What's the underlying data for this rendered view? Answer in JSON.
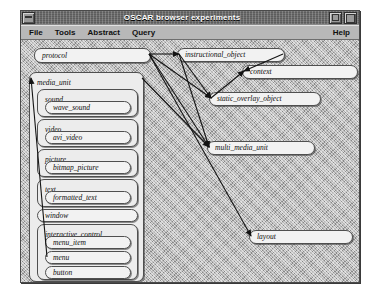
{
  "window": {
    "title": "OSCAR browser experiments",
    "menu_button_icon": "window-menu-icon",
    "minimize_icon": "minimize-icon",
    "maximize_icon": "maximize-icon"
  },
  "menubar": {
    "left_items": [
      {
        "label": "File"
      },
      {
        "label": "Tools"
      },
      {
        "label": "Abstract"
      },
      {
        "label": "Query"
      }
    ],
    "right_items": [
      {
        "label": "Help"
      }
    ]
  },
  "graph": {
    "nodes": [
      {
        "id": "protocol",
        "label": "protocol",
        "x": 13,
        "y": 8,
        "w": 117,
        "h": 15,
        "kind": "node"
      },
      {
        "id": "media_unit",
        "label": "media_unit",
        "x": 8,
        "y": 32,
        "w": 115,
        "h": 210,
        "kind": "group"
      },
      {
        "id": "sound",
        "label": "sound",
        "x": 16,
        "y": 49,
        "w": 101,
        "h": 28,
        "kind": "group"
      },
      {
        "id": "wave_sound",
        "label": "wave_sound",
        "x": 24,
        "y": 61,
        "w": 86,
        "h": 13,
        "kind": "node"
      },
      {
        "id": "video",
        "label": "video",
        "x": 16,
        "y": 79,
        "w": 101,
        "h": 28,
        "kind": "group"
      },
      {
        "id": "avi_video",
        "label": "avi_video",
        "x": 24,
        "y": 91,
        "w": 86,
        "h": 13,
        "kind": "node"
      },
      {
        "id": "picture",
        "label": "picture",
        "x": 16,
        "y": 109,
        "w": 101,
        "h": 28,
        "kind": "group"
      },
      {
        "id": "bitmap_picture",
        "label": "bitmap_picture",
        "x": 24,
        "y": 121,
        "w": 86,
        "h": 13,
        "kind": "node"
      },
      {
        "id": "text",
        "label": "text",
        "x": 16,
        "y": 139,
        "w": 101,
        "h": 28,
        "kind": "group"
      },
      {
        "id": "formatted_text",
        "label": "formatted_text",
        "x": 24,
        "y": 151,
        "w": 86,
        "h": 13,
        "kind": "node"
      },
      {
        "id": "window",
        "label": "window",
        "x": 16,
        "y": 169,
        "w": 101,
        "h": 13,
        "kind": "node"
      },
      {
        "id": "interactive_control",
        "label": "interactive_control",
        "x": 16,
        "y": 184,
        "w": 101,
        "h": 56,
        "kind": "group"
      },
      {
        "id": "menu_item",
        "label": "menu_item",
        "x": 24,
        "y": 196,
        "w": 86,
        "h": 13,
        "kind": "node"
      },
      {
        "id": "menu",
        "label": "menu",
        "x": 24,
        "y": 211,
        "w": 86,
        "h": 13,
        "kind": "node"
      },
      {
        "id": "button",
        "label": "button",
        "x": 24,
        "y": 226,
        "w": 86,
        "h": 13,
        "kind": "node"
      },
      {
        "id": "external_object",
        "label": "external_object",
        "x": 16,
        "y": 245,
        "w": 101,
        "h": 13,
        "kind": "node"
      },
      {
        "id": "instructional_object",
        "label": "instructional_object",
        "x": 156,
        "y": 8,
        "w": 108,
        "h": 14,
        "kind": "node"
      },
      {
        "id": "context",
        "label": "context",
        "x": 221,
        "y": 25,
        "w": 116,
        "h": 14,
        "kind": "node"
      },
      {
        "id": "static_overlay_object",
        "label": "static_overlay_object",
        "x": 188,
        "y": 52,
        "w": 112,
        "h": 14,
        "kind": "node"
      },
      {
        "id": "multi_media_unit",
        "label": "multi_media_unit",
        "x": 186,
        "y": 101,
        "w": 108,
        "h": 14,
        "kind": "node"
      },
      {
        "id": "layout",
        "label": "layout",
        "x": 228,
        "y": 190,
        "w": 104,
        "h": 14,
        "kind": "node"
      }
    ],
    "edges": [
      {
        "from": "protocol",
        "to": "instructional_object"
      },
      {
        "from": "protocol",
        "to": "static_overlay_object"
      },
      {
        "from": "protocol",
        "to": "multi_media_unit"
      },
      {
        "from": "protocol",
        "to": "layout"
      },
      {
        "from": "instructional_object",
        "to": "context"
      },
      {
        "from": "instructional_object",
        "to": "static_overlay_object"
      },
      {
        "from": "instructional_object",
        "to": "multi_media_unit"
      },
      {
        "from": "static_overlay_object",
        "to": "context"
      },
      {
        "from": "media_unit",
        "to": "multi_media_unit"
      },
      {
        "from": "menu",
        "to": "media_unit"
      }
    ]
  },
  "colors": {
    "titlebar": "#5c5c5c",
    "menubar": "#b8b8b8",
    "canvas": "#b4b4b4",
    "node_fill": "#f2f2f2",
    "node_border": "#4f4f4f",
    "edge": "#1a1a1a"
  }
}
